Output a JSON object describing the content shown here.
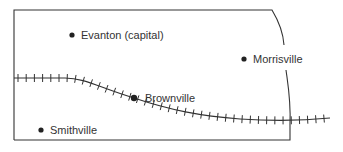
{
  "map": {
    "colors": {
      "ink": "#333333",
      "background": "#ffffff"
    },
    "cities": [
      {
        "name": "Evanton (capital)",
        "marker": "city-dot",
        "x": 72,
        "y": 35,
        "label_x": 81,
        "label_y": 29
      },
      {
        "name": "Morrisville",
        "marker": "city-dot",
        "x": 244,
        "y": 59,
        "label_x": 253,
        "label_y": 53
      },
      {
        "name": "Brownville",
        "marker": "city-dot",
        "x": 134,
        "y": 98,
        "label_x": 145,
        "label_y": 92
      },
      {
        "name": "Smithville",
        "marker": "city-dot",
        "x": 41,
        "y": 130,
        "label_x": 50,
        "label_y": 124
      }
    ],
    "features": {
      "border": "state-border",
      "railroad": "railroad-track"
    }
  }
}
